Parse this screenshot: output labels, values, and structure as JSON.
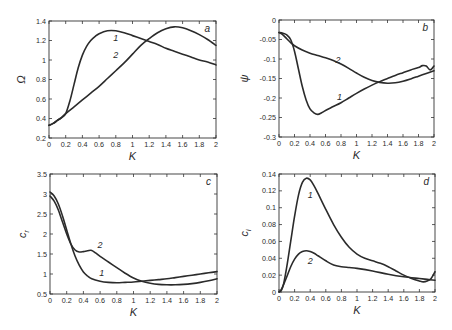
{
  "chart_data": [
    {
      "id": "a",
      "type": "line",
      "panel_letter": "a",
      "xlabel": "K",
      "ylabel": "Ω",
      "xlim": [
        0,
        2
      ],
      "ylim": [
        0.2,
        1.4
      ],
      "xticks": [
        0,
        0.2,
        0.4,
        0.6,
        0.8,
        1,
        1.2,
        1.4,
        1.6,
        1.8,
        2
      ],
      "xtick_labels": [
        "0",
        "0.2",
        "0.4",
        "0.6",
        "0.8",
        "1",
        "1.2",
        "1.4",
        "1.6",
        "1.8",
        "2"
      ],
      "yticks": [
        0.2,
        0.4,
        0.6,
        0.8,
        1.0,
        1.2,
        1.4
      ],
      "ytick_labels": [
        "0.2",
        "0.4",
        "0.6",
        "0.8",
        "1",
        "1.2",
        "1.4"
      ],
      "box": {
        "left": 49,
        "top": 21,
        "right": 216,
        "bottom": 138
      },
      "series": [
        {
          "name": "1",
          "label_pos": [
            0.8,
            1.2
          ],
          "x": [
            0,
            0.05,
            0.1,
            0.15,
            0.2,
            0.25,
            0.3,
            0.35,
            0.4,
            0.45,
            0.5,
            0.55,
            0.6,
            0.7,
            0.8,
            0.9,
            1.0,
            1.1,
            1.2,
            1.3,
            1.4,
            1.5,
            1.6,
            1.7,
            1.8,
            1.9,
            2.0
          ],
          "y": [
            0.33,
            0.35,
            0.38,
            0.41,
            0.45,
            0.58,
            0.75,
            0.92,
            1.05,
            1.14,
            1.2,
            1.24,
            1.27,
            1.3,
            1.3,
            1.28,
            1.25,
            1.22,
            1.19,
            1.16,
            1.12,
            1.09,
            1.06,
            1.03,
            1.0,
            0.98,
            0.95
          ]
        },
        {
          "name": "2",
          "label_pos": [
            0.8,
            1.02
          ],
          "x": [
            0,
            0.05,
            0.1,
            0.15,
            0.2,
            0.3,
            0.4,
            0.5,
            0.6,
            0.7,
            0.8,
            0.9,
            1.0,
            1.1,
            1.2,
            1.3,
            1.4,
            1.5,
            1.6,
            1.7,
            1.8,
            1.9,
            2.0
          ],
          "y": [
            0.33,
            0.35,
            0.38,
            0.41,
            0.45,
            0.52,
            0.59,
            0.66,
            0.73,
            0.81,
            0.89,
            0.97,
            1.06,
            1.15,
            1.22,
            1.28,
            1.32,
            1.34,
            1.33,
            1.3,
            1.26,
            1.21,
            1.15
          ]
        }
      ]
    },
    {
      "id": "b",
      "type": "line",
      "panel_letter": "b",
      "xlabel": "K",
      "ylabel": "ψ",
      "xlim": [
        0,
        2
      ],
      "ylim": [
        -0.3,
        0
      ],
      "xticks": [
        0,
        0.2,
        0.4,
        0.6,
        0.8,
        1,
        1.2,
        1.4,
        1.6,
        1.8,
        2
      ],
      "xtick_labels": [
        "0",
        "0.2",
        "0.4",
        "0.6",
        "0.8",
        "1",
        "1.2",
        "1.4",
        "1.6",
        "1.8",
        "2"
      ],
      "yticks": [
        0,
        -0.05,
        -0.1,
        -0.15,
        -0.2,
        -0.25,
        -0.3
      ],
      "ytick_labels": [
        "0",
        "-0.05",
        "-0.1",
        "-0.15",
        "-0.2",
        "-0.25",
        "-0.3"
      ],
      "box": {
        "left": 279,
        "top": 20,
        "right": 434,
        "bottom": 137
      },
      "series": [
        {
          "name": "1",
          "label_pos": [
            0.78,
            -0.205
          ],
          "x": [
            0,
            0.05,
            0.1,
            0.15,
            0.2,
            0.25,
            0.3,
            0.35,
            0.4,
            0.45,
            0.5,
            0.55,
            0.6,
            0.7,
            0.8,
            0.9,
            1.0,
            1.1,
            1.2,
            1.3,
            1.4,
            1.5,
            1.6,
            1.7,
            1.8,
            1.85,
            1.9,
            1.95,
            2.0
          ],
          "y": [
            -0.032,
            -0.034,
            -0.038,
            -0.05,
            -0.08,
            -0.125,
            -0.17,
            -0.205,
            -0.228,
            -0.238,
            -0.242,
            -0.238,
            -0.232,
            -0.222,
            -0.212,
            -0.2,
            -0.188,
            -0.177,
            -0.167,
            -0.158,
            -0.15,
            -0.142,
            -0.135,
            -0.128,
            -0.122,
            -0.117,
            -0.118,
            -0.128,
            -0.118
          ]
        },
        {
          "name": "2",
          "label_pos": [
            0.76,
            -0.11
          ],
          "x": [
            0,
            0.05,
            0.1,
            0.15,
            0.2,
            0.3,
            0.4,
            0.5,
            0.6,
            0.7,
            0.8,
            0.9,
            1.0,
            1.1,
            1.2,
            1.3,
            1.4,
            1.5,
            1.6,
            1.7,
            1.8,
            1.9,
            2.0
          ],
          "y": [
            -0.032,
            -0.038,
            -0.048,
            -0.058,
            -0.066,
            -0.077,
            -0.085,
            -0.091,
            -0.097,
            -0.104,
            -0.113,
            -0.124,
            -0.136,
            -0.147,
            -0.155,
            -0.16,
            -0.162,
            -0.161,
            -0.157,
            -0.151,
            -0.144,
            -0.137,
            -0.13
          ]
        }
      ]
    },
    {
      "id": "c",
      "type": "line",
      "panel_letter": "c",
      "xlabel": "K",
      "ylabel": "c_r",
      "xlim": [
        0,
        2
      ],
      "ylim": [
        0.5,
        3.5
      ],
      "xticks": [
        0,
        0.2,
        0.4,
        0.6,
        0.8,
        1,
        1.2,
        1.4,
        1.6,
        1.8,
        2
      ],
      "xtick_labels": [
        "0",
        "0.2",
        "0.4",
        "0.6",
        "0.8",
        "1",
        "1.2",
        "1.4",
        "1.6",
        "1.8",
        "2"
      ],
      "yticks": [
        0.5,
        1,
        1.5,
        2,
        2.5,
        3,
        3.5
      ],
      "ytick_labels": [
        "0.5",
        "1",
        "1.5",
        "2",
        "2.5",
        "3",
        "3.5"
      ],
      "box": {
        "left": 50,
        "top": 174,
        "right": 217,
        "bottom": 294
      },
      "series": [
        {
          "name": "1",
          "label_pos": [
            0.62,
            0.95
          ],
          "x": [
            0,
            0.05,
            0.1,
            0.15,
            0.2,
            0.25,
            0.3,
            0.35,
            0.4,
            0.45,
            0.5,
            0.6,
            0.7,
            0.8,
            0.9,
            1.0,
            1.1,
            1.2,
            1.3,
            1.4,
            1.5,
            1.6,
            1.7,
            1.8,
            1.9,
            2.0
          ],
          "y": [
            3.05,
            2.95,
            2.75,
            2.45,
            2.1,
            1.75,
            1.45,
            1.22,
            1.05,
            0.95,
            0.88,
            0.82,
            0.79,
            0.78,
            0.79,
            0.8,
            0.82,
            0.84,
            0.86,
            0.88,
            0.91,
            0.94,
            0.97,
            1.0,
            1.03,
            1.06
          ]
        },
        {
          "name": "2",
          "label_pos": [
            0.6,
            1.65
          ],
          "x": [
            0,
            0.05,
            0.1,
            0.15,
            0.2,
            0.25,
            0.3,
            0.35,
            0.4,
            0.45,
            0.5,
            0.55,
            0.6,
            0.7,
            0.8,
            0.9,
            1.0,
            1.1,
            1.2,
            1.3,
            1.4,
            1.5,
            1.6,
            1.7,
            1.8,
            1.9,
            2.0
          ],
          "y": [
            2.95,
            2.82,
            2.6,
            2.3,
            2.0,
            1.75,
            1.6,
            1.55,
            1.56,
            1.58,
            1.59,
            1.52,
            1.44,
            1.3,
            1.16,
            1.02,
            0.9,
            0.82,
            0.77,
            0.74,
            0.73,
            0.73,
            0.74,
            0.76,
            0.79,
            0.83,
            0.88
          ]
        }
      ]
    },
    {
      "id": "d",
      "type": "line",
      "panel_letter": "d",
      "xlabel": "K",
      "ylabel": "c_i",
      "xlim": [
        0,
        2
      ],
      "ylim": [
        0,
        0.14
      ],
      "xticks": [
        0,
        0.2,
        0.4,
        0.6,
        0.8,
        1,
        1.2,
        1.4,
        1.6,
        1.8,
        2
      ],
      "xtick_labels": [
        "0",
        "0.2",
        "0.4",
        "0.6",
        "0.8",
        "1",
        "1.2",
        "1.4",
        "1.6",
        "1.8",
        "2"
      ],
      "yticks": [
        0,
        0.02,
        0.04,
        0.06,
        0.08,
        0.1,
        0.12,
        0.14
      ],
      "ytick_labels": [
        "0",
        "0.02",
        "0.04",
        "0.06",
        "0.08",
        "0.1",
        "0.12",
        "0.14"
      ],
      "box": {
        "left": 279,
        "top": 174,
        "right": 435,
        "bottom": 292
      },
      "series": [
        {
          "name": "1",
          "label_pos": [
            0.4,
            0.112
          ],
          "x": [
            0,
            0.03,
            0.06,
            0.1,
            0.15,
            0.2,
            0.25,
            0.3,
            0.35,
            0.4,
            0.45,
            0.5,
            0.6,
            0.7,
            0.8,
            0.9,
            1.0,
            1.1,
            1.2,
            1.3,
            1.4,
            1.5,
            1.6,
            1.7,
            1.8,
            1.85,
            1.9,
            1.95,
            2.0
          ],
          "y": [
            0.0,
            0.002,
            0.01,
            0.03,
            0.06,
            0.09,
            0.115,
            0.13,
            0.135,
            0.133,
            0.126,
            0.117,
            0.098,
            0.08,
            0.065,
            0.053,
            0.045,
            0.04,
            0.037,
            0.034,
            0.03,
            0.025,
            0.02,
            0.016,
            0.013,
            0.012,
            0.013,
            0.016,
            0.024
          ]
        },
        {
          "name": "2",
          "label_pos": [
            0.4,
            0.033
          ],
          "x": [
            0,
            0.03,
            0.06,
            0.1,
            0.15,
            0.2,
            0.25,
            0.3,
            0.35,
            0.4,
            0.45,
            0.5,
            0.6,
            0.7,
            0.8,
            0.9,
            1.0,
            1.2,
            1.4,
            1.6,
            1.8,
            1.9,
            2.0
          ],
          "y": [
            0.0,
            0.003,
            0.009,
            0.018,
            0.03,
            0.039,
            0.045,
            0.048,
            0.049,
            0.048,
            0.046,
            0.043,
            0.037,
            0.032,
            0.03,
            0.029,
            0.028,
            0.025,
            0.021,
            0.018,
            0.016,
            0.015,
            0.014
          ]
        }
      ]
    }
  ]
}
